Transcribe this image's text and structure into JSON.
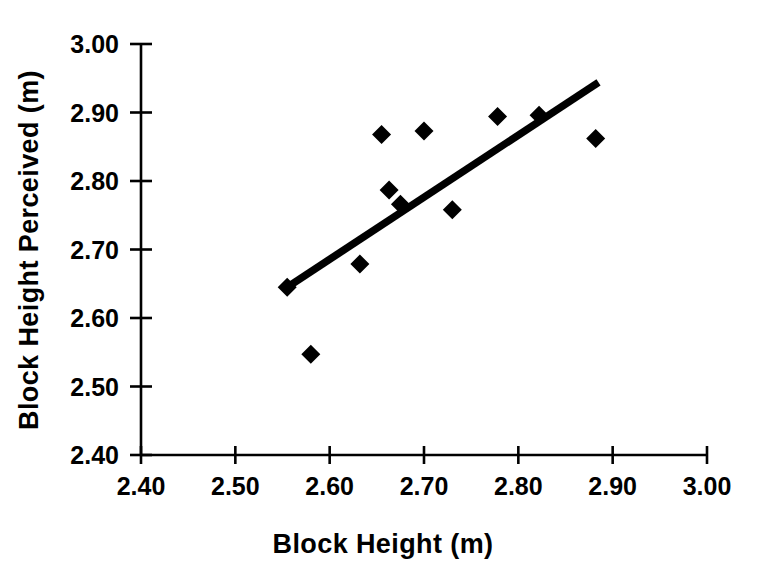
{
  "chart_data": {
    "type": "scatter",
    "title": "",
    "xlabel": "Block Height (m)",
    "ylabel": "Block Height Perceived (m)",
    "xlim": [
      2.4,
      3.0
    ],
    "ylim": [
      2.4,
      3.0
    ],
    "xticks": [
      "2.40",
      "2.50",
      "2.60",
      "2.70",
      "2.80",
      "2.90",
      "3.00"
    ],
    "yticks": [
      "2.40",
      "2.50",
      "2.60",
      "2.70",
      "2.80",
      "2.90",
      "3.00"
    ],
    "xtick_values": [
      2.4,
      2.5,
      2.6,
      2.7,
      2.8,
      2.9,
      3.0
    ],
    "ytick_values": [
      2.4,
      2.5,
      2.6,
      2.7,
      2.8,
      2.9,
      3.0
    ],
    "grid": false,
    "legend": null,
    "marker_style": "filled-diamond",
    "marker_color": "#000000",
    "series": [
      {
        "name": "Observations",
        "points": [
          {
            "x": 2.555,
            "y": 2.645
          },
          {
            "x": 2.58,
            "y": 2.547
          },
          {
            "x": 2.632,
            "y": 2.679
          },
          {
            "x": 2.655,
            "y": 2.868
          },
          {
            "x": 2.663,
            "y": 2.787
          },
          {
            "x": 2.675,
            "y": 2.766
          },
          {
            "x": 2.7,
            "y": 2.873
          },
          {
            "x": 2.73,
            "y": 2.758
          },
          {
            "x": 2.778,
            "y": 2.894
          },
          {
            "x": 2.822,
            "y": 2.896
          },
          {
            "x": 2.882,
            "y": 2.862
          }
        ]
      }
    ],
    "trendline": {
      "name": "Linear fit",
      "x_start": 2.554,
      "y_start": 2.644,
      "x_end": 2.885,
      "y_end": 2.944,
      "color": "#000000"
    }
  }
}
